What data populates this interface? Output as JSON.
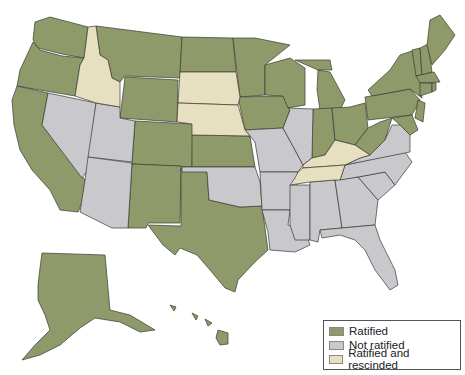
{
  "colors": {
    "ratified": "#8e9a6a",
    "not_ratified": "#c8c8cd",
    "rescinded": "#e6e0c0",
    "border": "#3a3a30",
    "background": "#ffffff"
  },
  "legend": {
    "items": [
      {
        "key": "ratified",
        "label": "Ratified",
        "color": "#8e9a6a"
      },
      {
        "key": "not_ratified",
        "label": "Not ratified",
        "color": "#c8c8cd"
      },
      {
        "key": "rescinded",
        "label": "Ratified and rescinded",
        "color": "#e6e0c0"
      }
    ]
  },
  "states": {
    "ratified": [
      "WA",
      "OR",
      "CA",
      "MT",
      "WY",
      "CO",
      "NM",
      "TX",
      "ND",
      "KS",
      "MN",
      "IA",
      "WI",
      "MI",
      "IN",
      "OH",
      "WV",
      "PA",
      "NY",
      "VT",
      "NH",
      "ME",
      "MA",
      "RI",
      "CT",
      "NJ",
      "DE",
      "MD",
      "AK",
      "HI"
    ],
    "not_ratified": [
      "NV",
      "UT",
      "AZ",
      "OK",
      "MO",
      "AR",
      "LA",
      "IL",
      "MS",
      "AL",
      "GA",
      "FL",
      "SC",
      "NC",
      "VA"
    ],
    "rescinded": [
      "ID",
      "SD",
      "NE",
      "KY",
      "TN"
    ]
  }
}
